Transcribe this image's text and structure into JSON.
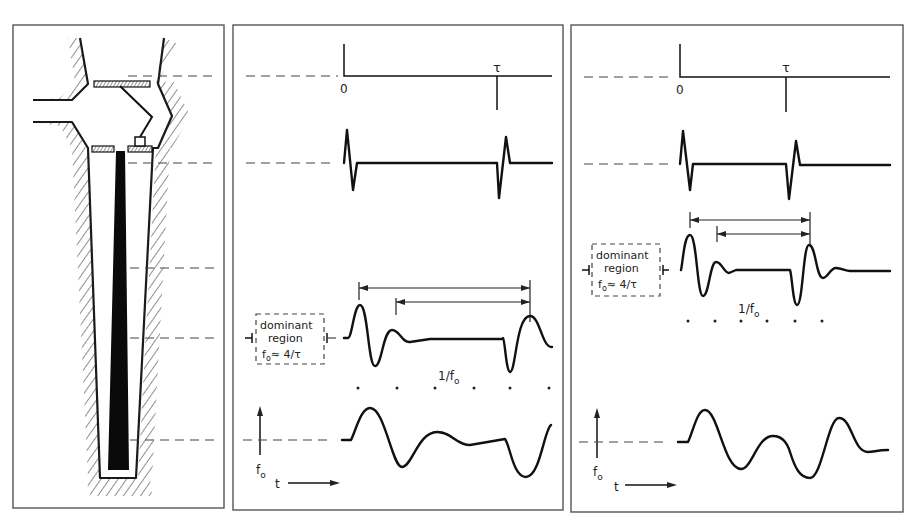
{
  "figure": {
    "colors": {
      "ink": "#111111",
      "paper": "#ffffff",
      "border": "#555555"
    }
  },
  "left_panel": {
    "name": "resonator-cross-section",
    "parts": [
      "hatched-walls",
      "upper-chamber",
      "side-inlet-tube",
      "reed-plate-top",
      "reed-plate-bottom",
      "hinged-reed",
      "tongue-block",
      "tapered-bore",
      "black-inner-rod"
    ]
  },
  "middle_panel": {
    "impulse": {
      "origin_label": "0",
      "delay_label": "τ"
    },
    "box": {
      "line1": "dominant",
      "line2": "region",
      "line3_f": "f",
      "line3_sub": "o",
      "line3_rest": "≈ 4/τ"
    },
    "period_label": {
      "main": "1/f",
      "sub": "o"
    },
    "axis": {
      "y_label": "f",
      "y_sub": "o",
      "x_label": "t"
    },
    "dot_count": 6
  },
  "right_panel": {
    "impulse": {
      "origin_label": "0",
      "delay_label": "τ"
    },
    "box": {
      "line1": "dominant",
      "line2": "region",
      "line3_f": "f",
      "line3_sub": "o",
      "line3_rest": "≈ 4/τ"
    },
    "period_label": {
      "main": "1/f",
      "sub": "o"
    },
    "axis": {
      "y_label": "f",
      "y_sub": "o",
      "x_label": "t"
    },
    "dot_count": 6
  }
}
